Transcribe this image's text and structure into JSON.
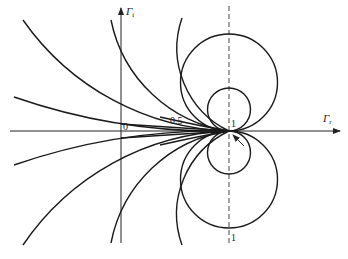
{
  "figure": {
    "type": "reflection-coefficient plane with circle family tangent at (1,0)",
    "axes": {
      "horizontal_label": "Γ",
      "horizontal_subscript": "r",
      "vertical_label": "Γ",
      "vertical_subscript": "i"
    },
    "labels": {
      "origin": "0",
      "half": "0.5",
      "one_top": "1",
      "one_bottom": "1"
    },
    "colors": {
      "ink": "#1a1a1a",
      "background": "#ffffff"
    }
  }
}
